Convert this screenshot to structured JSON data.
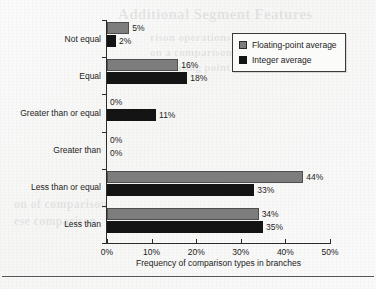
{
  "chart_data": {
    "type": "bar",
    "orientation": "horizontal",
    "title": "",
    "xlabel": "Frequency of comparison types in branches",
    "ylabel": "",
    "xlim": [
      0,
      50
    ],
    "xticks": [
      "0%",
      "10%",
      "20%",
      "30%",
      "40%",
      "50%"
    ],
    "xtick_values": [
      0,
      10,
      20,
      30,
      40,
      50
    ],
    "grid": false,
    "legend_position": "upper right",
    "categories": [
      "Not equal",
      "Equal",
      "Greater than or equal",
      "Greater than",
      "Less than or equal",
      "Less than"
    ],
    "series": [
      {
        "name": "Floating-point average",
        "color": "#7d7d7d",
        "values": [
          5,
          16,
          0,
          0,
          44,
          34
        ],
        "labels": [
          "5%",
          "16%",
          "0%",
          "0%",
          "44%",
          "34%"
        ]
      },
      {
        "name": "Integer average",
        "color": "#141414",
        "values": [
          2,
          18,
          11,
          0,
          33,
          35
        ],
        "labels": [
          "2%",
          "18%",
          "11%",
          "0%",
          "33%",
          "35%"
        ]
      }
    ]
  },
  "legend": {
    "items": [
      {
        "label": "Floating-point average",
        "swatch": "gray"
      },
      {
        "label": "Integer average",
        "swatch": "black"
      }
    ]
  },
  "artifacts": {
    "ghost_title": "Additional Segment Features",
    "ghost_body_line1": "rison operations are",
    "ghost_body_line2": "on a comparison",
    "ghost_body_line3": "of floating point",
    "ghost_lower_line1": "on of comparison",
    "ghost_lower_line2": "ese comparison"
  }
}
